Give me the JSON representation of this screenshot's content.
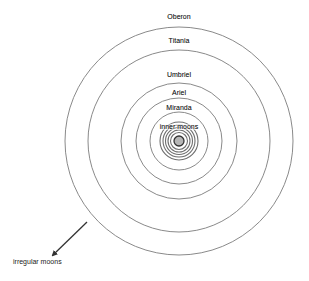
{
  "diagram": {
    "title": "",
    "center": {
      "x": 179,
      "y": 141
    },
    "colors": {
      "orbit": "#8a8a8a",
      "inner_ring": "#6f6f6f",
      "planet_fill": "#b5b5b5",
      "planet_stroke": "#333333",
      "text": "#222222",
      "arrow": "#333333"
    },
    "orbits": [
      {
        "name": "Oberon",
        "label": "Oberon",
        "r": 114,
        "label_y": 19
      },
      {
        "name": "Titania",
        "label": "Titania",
        "r": 91,
        "label_y": 43
      },
      {
        "name": "Umbriel",
        "label": "Umbriel",
        "r": 58,
        "label_y": 77
      },
      {
        "name": "Ariel",
        "label": "Ariel",
        "r": 43,
        "label_y": 95
      },
      {
        "name": "Miranda",
        "label": "Miranda",
        "r": 29,
        "label_y": 110
      }
    ],
    "inner_moons": {
      "label": "inner moons",
      "label_y": 129,
      "ring_radii": [
        19,
        16,
        13.5,
        11,
        8.5
      ]
    },
    "planet": {
      "r": 5
    },
    "irregular": {
      "label": "irregular moons",
      "arrow": {
        "x1": 87,
        "y1": 222,
        "x2": 53,
        "y2": 255
      },
      "label_x": 13,
      "label_y": 264
    }
  }
}
